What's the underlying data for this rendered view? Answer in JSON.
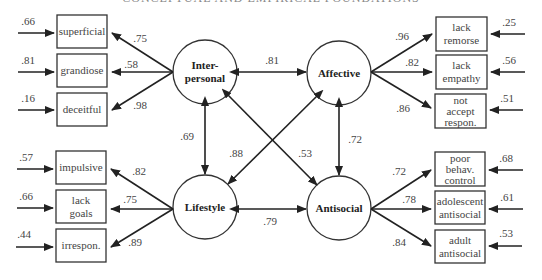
{
  "title": "CONCEPTUAL AND EMPIRICAL FOUNDATIONS",
  "latent_factors": [
    {
      "id": "interpersonal",
      "lines": [
        "Inter-",
        "personal"
      ]
    },
    {
      "id": "affective",
      "lines": [
        "Affective"
      ]
    },
    {
      "id": "lifestyle",
      "lines": [
        "Lifestyle"
      ]
    },
    {
      "id": "antisocial",
      "lines": [
        "Antisocial"
      ]
    }
  ],
  "factor_correlations": {
    "interpersonal_affective": ".81",
    "lifestyle_antisocial": ".79",
    "interpersonal_lifestyle": ".69",
    "affective_antisocial": ".72",
    "affective_lifestyle": ".88",
    "interpersonal_antisocial": ".53"
  },
  "indicators": {
    "interpersonal": [
      {
        "lines": [
          "superficial"
        ],
        "loading": ".75",
        "error": ".66"
      },
      {
        "lines": [
          "grandiose"
        ],
        "loading": ".58",
        "error": ".81"
      },
      {
        "lines": [
          "deceitful"
        ],
        "loading": ".98",
        "error": ".16"
      }
    ],
    "lifestyle": [
      {
        "lines": [
          "impulsive"
        ],
        "loading": ".82",
        "error": ".57"
      },
      {
        "lines": [
          "lack",
          "goals"
        ],
        "loading": ".75",
        "error": ".66"
      },
      {
        "lines": [
          "irrespon."
        ],
        "loading": ".89",
        "error": ".44"
      }
    ],
    "affective": [
      {
        "lines": [
          "lack",
          "remorse"
        ],
        "loading": ".96",
        "error": ".25"
      },
      {
        "lines": [
          "lack",
          "empathy"
        ],
        "loading": ".82",
        "error": ".56"
      },
      {
        "lines": [
          "not",
          "accept",
          "respon."
        ],
        "loading": ".86",
        "error": ".51"
      }
    ],
    "antisocial": [
      {
        "lines": [
          "poor",
          "behav.",
          "control"
        ],
        "loading": ".72",
        "error": ".68"
      },
      {
        "lines": [
          "adolescent",
          "antisocial"
        ],
        "loading": ".78",
        "error": ".61"
      },
      {
        "lines": [
          "adult",
          "antisocial"
        ],
        "loading": ".84",
        "error": ".53"
      }
    ]
  }
}
